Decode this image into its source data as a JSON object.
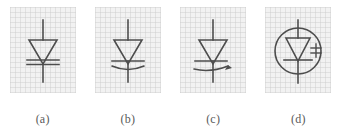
{
  "figure": {
    "background_color": "#ffffff",
    "panel_color": "#f2f2f2",
    "line_color": "#4d4d4d",
    "caption_color": "#5a5a5a",
    "panel_count": 4
  },
  "panels": [
    {
      "id": "a",
      "caption": "(a)",
      "symbol_name": "zener-diode-symbol",
      "description": "Diode triangle with doubled straight cathode bar",
      "features": [
        "lead-top",
        "triangle-anode",
        "cathode-bar",
        "cathode-bar-second",
        "lead-bottom"
      ]
    },
    {
      "id": "b",
      "caption": "(b)",
      "symbol_name": "varactor-diode-symbol",
      "description": "Diode triangle with straight cathode bar and curved arc below",
      "features": [
        "lead-top",
        "triangle-anode",
        "cathode-bar",
        "capacitance-arc",
        "lead-bottom"
      ]
    },
    {
      "id": "c",
      "caption": "(c)",
      "symbol_name": "variable-capacitance-diode-symbol",
      "description": "Diode triangle with cathode bar and arc terminating in an arrowhead",
      "features": [
        "lead-top",
        "triangle-anode",
        "cathode-bar",
        "capacitance-arc",
        "arrowhead",
        "lead-bottom"
      ]
    },
    {
      "id": "d",
      "caption": "(d)",
      "symbol_name": "encircled-tuning-diode-symbol",
      "description": "Diode triangle with cathode bar enclosed in a circle, small tuning mark at right",
      "features": [
        "enclosing-circle",
        "lead-top",
        "triangle-anode",
        "cathode-bar",
        "tuning-mark",
        "lead-bottom"
      ]
    }
  ]
}
